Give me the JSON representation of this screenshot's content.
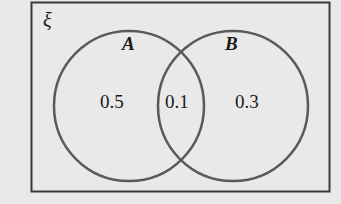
{
  "diagram": {
    "type": "venn",
    "universal_set_label": "ξ",
    "sets": [
      {
        "name": "A",
        "only_value": "0.5"
      },
      {
        "name": "B",
        "only_value": "0.3"
      }
    ],
    "intersection_value": "0.1",
    "colors": {
      "background": "#e9e9e9",
      "outline": "#555555",
      "text": "#1a1a1a"
    }
  }
}
